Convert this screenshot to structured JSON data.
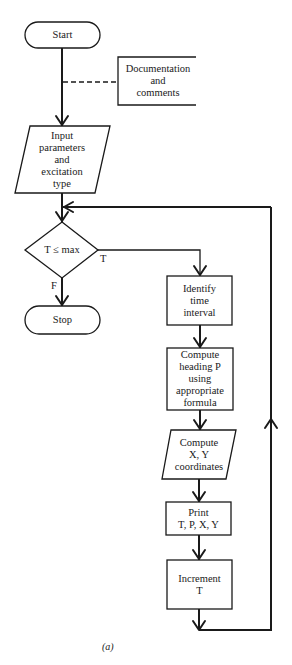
{
  "figure": {
    "caption": "(a)",
    "colors": {
      "stroke": "#1a1a1a",
      "background": "#ffffff"
    }
  },
  "nodes": {
    "start": {
      "type": "terminal",
      "lines": [
        "Start"
      ]
    },
    "annotation": {
      "type": "annotation",
      "lines": [
        "Documentation",
        "and",
        "comments"
      ]
    },
    "input": {
      "type": "io",
      "lines": [
        "Input",
        "parameters",
        "and",
        "excitation",
        "type"
      ]
    },
    "decision": {
      "type": "decision",
      "lines": [
        "T ≤ max"
      ]
    },
    "stop": {
      "type": "terminal",
      "lines": [
        "Stop"
      ]
    },
    "identify": {
      "type": "process",
      "lines": [
        "Identify",
        "time",
        "interval"
      ]
    },
    "compute_heading": {
      "type": "process",
      "lines": [
        "Compute",
        "heading P",
        "using",
        "appropriate",
        "formula"
      ]
    },
    "compute_xy": {
      "type": "io",
      "lines": [
        "Compute",
        "X, Y",
        "coordinates"
      ]
    },
    "print": {
      "type": "process",
      "lines": [
        "Print",
        "T, P, X, Y"
      ]
    },
    "increment": {
      "type": "process",
      "lines": [
        "Increment",
        "T"
      ]
    }
  },
  "branches": {
    "true_label": "T",
    "false_label": "F"
  }
}
